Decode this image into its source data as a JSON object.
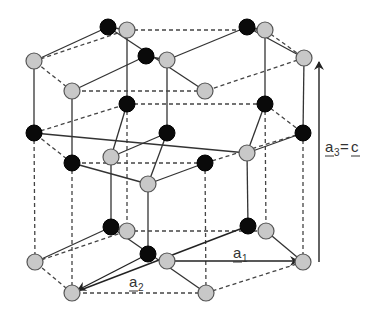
{
  "diagram": {
    "atom_colors": {
      "species_a": "#0a0a0a",
      "species_b": "#c8c8c8"
    },
    "labels": {
      "a1": {
        "base": "a",
        "sub": "1"
      },
      "a2": {
        "base": "a",
        "sub": "2"
      },
      "a3": {
        "base": "a",
        "sub": "3",
        "eq": "=",
        "rhs": "c"
      }
    },
    "layers": {
      "top": {
        "gray": [
          [
            127,
            30
          ],
          [
            34,
            61
          ],
          [
            167,
            60
          ],
          [
            265,
            30
          ],
          [
            304,
            58
          ],
          [
            72,
            91
          ],
          [
            205,
            91
          ]
        ],
        "black": [
          [
            108,
            27
          ],
          [
            146,
            56
          ],
          [
            247,
            27
          ]
        ]
      },
      "middle": {
        "black": [
          [
            34,
            133
          ],
          [
            127,
            104
          ],
          [
            167,
            133
          ],
          [
            265,
            104
          ],
          [
            303,
            133
          ],
          [
            72,
            163
          ],
          [
            205,
            163
          ]
        ],
        "gray": [
          [
            111,
            157
          ],
          [
            247,
            153
          ],
          [
            148,
            184
          ]
        ]
      },
      "bottom": {
        "gray": [
          [
            127,
            231
          ],
          [
            35,
            262
          ],
          [
            167,
            261
          ],
          [
            266,
            231
          ],
          [
            303,
            262
          ],
          [
            72,
            293
          ],
          [
            206,
            293
          ]
        ],
        "black": [
          [
            111,
            227
          ],
          [
            148,
            254
          ],
          [
            248,
            226
          ]
        ]
      }
    }
  }
}
